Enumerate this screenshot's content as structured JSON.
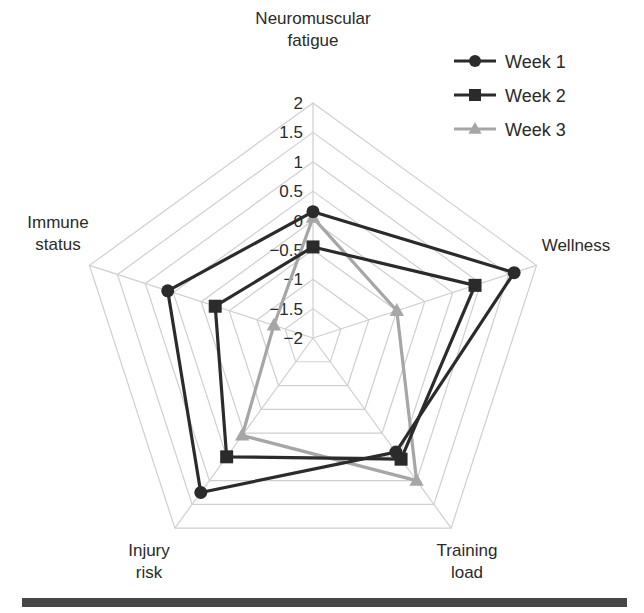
{
  "chart_data": {
    "type": "radar",
    "title": "",
    "axes": [
      "Neuromuscular fatigue",
      "Wellness",
      "Training load",
      "Injury risk",
      "Immune status"
    ],
    "axis_label_lines": [
      [
        "Neuromuscular",
        "fatigue"
      ],
      [
        "Wellness"
      ],
      [
        "Training",
        "load"
      ],
      [
        "Injury",
        "risk"
      ],
      [
        "Immune",
        "status"
      ]
    ],
    "range": [
      -2,
      2
    ],
    "ticks": [
      2,
      1.5,
      1,
      0.5,
      0,
      -0.5,
      -1,
      -1.5,
      -2
    ],
    "tick_labels": [
      "2",
      "1.5",
      "1",
      "0.5",
      "0",
      "−0.5",
      "−1",
      "−1.5",
      "−2"
    ],
    "grid": true,
    "legend_position": "top-right",
    "series": [
      {
        "name": "Week 1",
        "marker": "circle",
        "color": "#2b2b2b",
        "values": [
          0.15,
          1.6,
          0.4,
          1.25,
          0.6
        ]
      },
      {
        "name": "Week 2",
        "marker": "square",
        "color": "#2b2b2b",
        "values": [
          -0.45,
          0.9,
          0.55,
          0.5,
          -0.25
        ]
      },
      {
        "name": "Week 3",
        "marker": "triangle",
        "color": "#a6a6a6",
        "values": [
          0.05,
          -0.5,
          1.0,
          0.05,
          -1.3
        ]
      }
    ]
  },
  "colors": {
    "grid": "#cfcfcf",
    "text": "#2a2a2a",
    "bottom_bar": "#474747"
  }
}
